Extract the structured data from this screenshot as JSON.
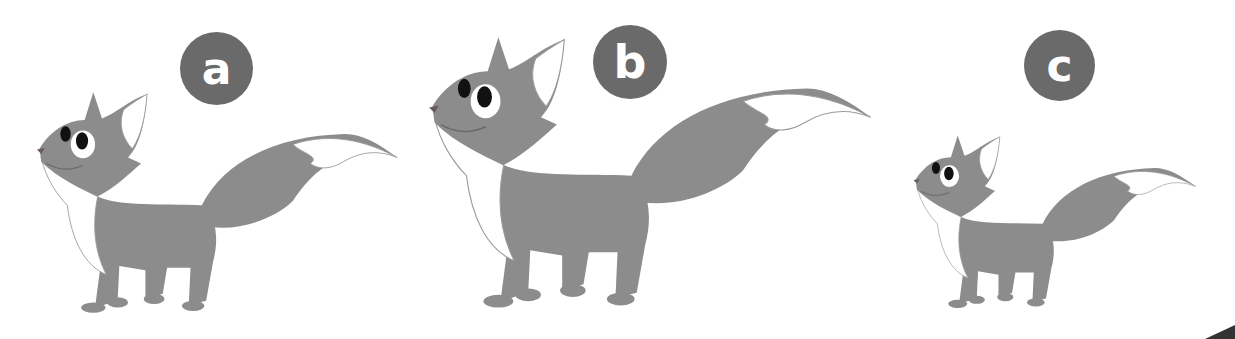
{
  "colors": {
    "fox_body": "#8c8c8c",
    "fox_white": "#ffffff",
    "badge_bg": "#6a6a6a",
    "eye": "#111111",
    "outline": "#9a9a9a"
  },
  "figures": [
    {
      "label": "a",
      "size": "medium"
    },
    {
      "label": "b",
      "size": "large"
    },
    {
      "label": "c",
      "size": "small"
    }
  ]
}
